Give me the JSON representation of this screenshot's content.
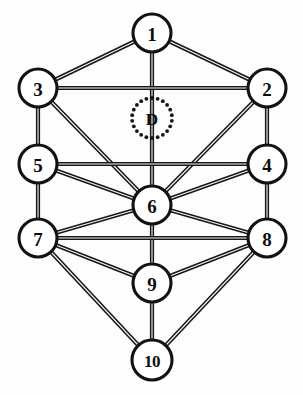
{
  "diagram": {
    "type": "node-link-graph",
    "background_color": "#fdfdfd",
    "line_color": "#171717",
    "node_fill": "#ffffff",
    "node_stroke": "#121212",
    "width": 303,
    "height": 395,
    "nodes": [
      {
        "id": "n1",
        "label": "1",
        "cx": 152,
        "cy": 33,
        "r": 19,
        "style": "solid"
      },
      {
        "id": "n2",
        "label": "2",
        "cx": 267,
        "cy": 88,
        "r": 19,
        "style": "solid"
      },
      {
        "id": "n3",
        "label": "3",
        "cx": 38,
        "cy": 88,
        "r": 19,
        "style": "solid"
      },
      {
        "id": "n4",
        "label": "4",
        "cx": 267,
        "cy": 164,
        "r": 19,
        "style": "solid"
      },
      {
        "id": "n5",
        "label": "5",
        "cx": 38,
        "cy": 164,
        "r": 19,
        "style": "solid"
      },
      {
        "id": "n6",
        "label": "6",
        "cx": 152,
        "cy": 205,
        "r": 19,
        "style": "solid"
      },
      {
        "id": "n7",
        "label": "7",
        "cx": 38,
        "cy": 238,
        "r": 19,
        "style": "solid"
      },
      {
        "id": "n8",
        "label": "8",
        "cx": 267,
        "cy": 238,
        "r": 19,
        "style": "solid"
      },
      {
        "id": "n9",
        "label": "9",
        "cx": 152,
        "cy": 283,
        "r": 19,
        "style": "solid"
      },
      {
        "id": "n10",
        "label": "10",
        "cx": 152,
        "cy": 360,
        "r": 20,
        "style": "solid"
      },
      {
        "id": "nD",
        "label": "D",
        "cx": 152,
        "cy": 118,
        "r": 20,
        "style": "dotted"
      }
    ],
    "edges": [
      {
        "from": "n1",
        "to": "n3"
      },
      {
        "from": "n1",
        "to": "n2"
      },
      {
        "from": "n1",
        "to": "n6"
      },
      {
        "from": "n3",
        "to": "n2"
      },
      {
        "from": "n3",
        "to": "n5"
      },
      {
        "from": "n3",
        "to": "n6"
      },
      {
        "from": "n2",
        "to": "n4"
      },
      {
        "from": "n2",
        "to": "n6"
      },
      {
        "from": "n5",
        "to": "n4"
      },
      {
        "from": "n5",
        "to": "n6"
      },
      {
        "from": "n5",
        "to": "n7"
      },
      {
        "from": "n4",
        "to": "n6"
      },
      {
        "from": "n4",
        "to": "n8"
      },
      {
        "from": "n6",
        "to": "n7"
      },
      {
        "from": "n6",
        "to": "n8"
      },
      {
        "from": "n6",
        "to": "n9"
      },
      {
        "from": "n7",
        "to": "n8"
      },
      {
        "from": "n7",
        "to": "n9"
      },
      {
        "from": "n7",
        "to": "n10"
      },
      {
        "from": "n8",
        "to": "n9"
      },
      {
        "from": "n8",
        "to": "n10"
      },
      {
        "from": "n9",
        "to": "n10"
      }
    ],
    "daath": {
      "label": "D",
      "cx": 152,
      "cy": 118,
      "ring_radius": 20,
      "dot_count": 22,
      "dot_radius": 1.9
    }
  }
}
